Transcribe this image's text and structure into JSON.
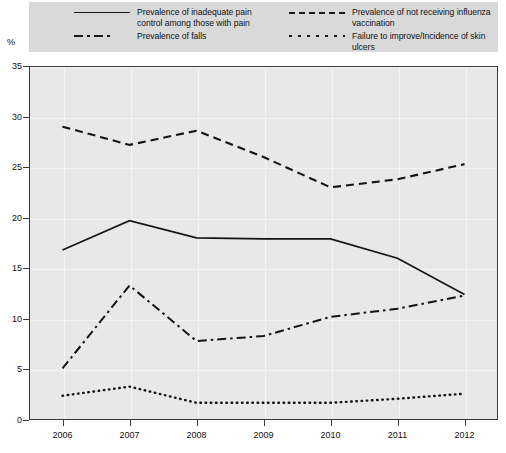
{
  "axis_unit": "%",
  "legend": {
    "entries": [
      {
        "id": "pain",
        "style": "solid",
        "label": "Prevalence of inadequate pain\ncontrol among those with pain"
      },
      {
        "id": "falls",
        "style": "dashdot",
        "label": "Prevalence of falls"
      },
      {
        "id": "influenza",
        "style": "dashed",
        "label": "Prevalence of not receiving influenza\nvaccination"
      },
      {
        "id": "ulcers",
        "style": "dotted",
        "label": "Failure to improve/Incidence of skin ulcers"
      }
    ]
  },
  "caption": "",
  "chart_data": {
    "type": "line",
    "title": "",
    "xlabel": "",
    "ylabel": "%",
    "x": [
      "2006",
      "2007",
      "2008",
      "2009",
      "2010",
      "2011",
      "2012"
    ],
    "categories": [
      "2006",
      "2007",
      "2008",
      "2009",
      "2010",
      "2011",
      "2012"
    ],
    "xlim": [
      2005.5,
      2012.5
    ],
    "ylim": [
      0,
      35
    ],
    "yticks": [
      0,
      5,
      10,
      15,
      20,
      25,
      30,
      35
    ],
    "ytick_labels": [
      "0",
      "5",
      "10",
      "15",
      "20",
      "25",
      "30",
      "35"
    ],
    "xticks": [
      "2006",
      "2007",
      "2008",
      "2009",
      "2010",
      "2011",
      "2012"
    ],
    "grid": true,
    "legend_position": "top",
    "series": [
      {
        "name": "Prevalence of inadequate pain control among those with pain",
        "style": "solid",
        "color": "#141414",
        "values": [
          16.8,
          19.7,
          18.0,
          17.9,
          17.9,
          16.0,
          12.4
        ]
      },
      {
        "name": "Prevalence of not receiving influenza vaccination",
        "style": "dashed",
        "color": "#141414",
        "values": [
          29.0,
          27.2,
          28.6,
          26.0,
          23.0,
          23.8,
          25.3
        ]
      },
      {
        "name": "Prevalence of falls",
        "style": "dashdot",
        "color": "#141414",
        "values": [
          5.1,
          13.3,
          7.8,
          8.3,
          10.2,
          11.0,
          12.3
        ]
      },
      {
        "name": "Failure to improve/Incidence of skin ulcers",
        "style": "dotted",
        "color": "#141414",
        "values": [
          2.4,
          3.3,
          1.7,
          1.7,
          1.7,
          2.1,
          2.6
        ]
      }
    ]
  }
}
